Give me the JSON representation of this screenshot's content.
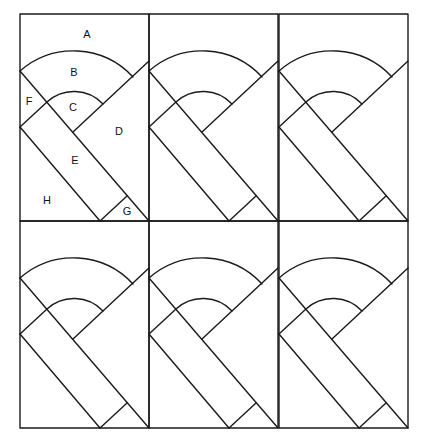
{
  "diagram": {
    "type": "quilt-block-pattern",
    "grid": {
      "rows": 2,
      "cols": 3
    },
    "line_color": "#1a1a1a",
    "background": "#ffffff",
    "piece_labels": [
      {
        "id": "A",
        "text": "A"
      },
      {
        "id": "B",
        "text": "B"
      },
      {
        "id": "C",
        "text": "C"
      },
      {
        "id": "D",
        "text": "D"
      },
      {
        "id": "E",
        "text": "E"
      },
      {
        "id": "F",
        "text": "F"
      },
      {
        "id": "G",
        "text": "G"
      },
      {
        "id": "H",
        "text": "H"
      }
    ],
    "labeled_block": "row 1, column 1"
  }
}
